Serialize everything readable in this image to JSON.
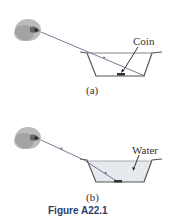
{
  "panels": [
    {
      "id": "a",
      "label": "(a)",
      "annotation": "Coin"
    },
    {
      "id": "b",
      "label": "(b)",
      "annotation": "Water"
    }
  ],
  "caption": "Figure A22.1",
  "colors": {
    "line": "#555555",
    "ray": "#6a6a8a",
    "water": "#e6e9ee",
    "caption": "#2a3d6e"
  }
}
